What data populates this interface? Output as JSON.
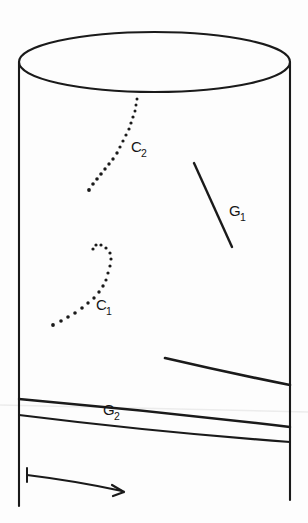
{
  "figure": {
    "background_color": "#fdfdfd",
    "ink_color": "#1a1a1a",
    "width": 308,
    "height": 523
  },
  "labels": {
    "c1": {
      "base": "C",
      "sub": "1",
      "x": 96,
      "y": 310
    },
    "c2": {
      "base": "C",
      "sub": "2",
      "x": 131,
      "y": 152
    },
    "g1": {
      "base": "G",
      "sub": "1",
      "x": 229,
      "y": 216
    },
    "g2": {
      "base": "G",
      "sub": "2",
      "x": 103,
      "y": 415
    }
  },
  "shapes": {
    "cylinder_top_ellipse": {
      "name": "cylinder-top-ellipse",
      "cx": 154.5,
      "cy": 62,
      "rx": 135.5,
      "ry": 30
    },
    "left_edge": {
      "name": "cylinder-left-edge",
      "x": 19,
      "y1": 62,
      "y2": 506
    },
    "right_edge": {
      "name": "cylinder-right-edge",
      "x": 290,
      "y1": 62,
      "y2": 500
    },
    "curve_c2": {
      "name": "dotted-curve-c2",
      "description": "dotted curve from top rim descending left",
      "dots": [
        [
          137,
          99
        ],
        [
          136,
          104
        ],
        [
          135,
          110
        ],
        [
          133,
          116
        ],
        [
          131,
          122
        ],
        [
          129,
          128
        ],
        [
          127,
          134
        ],
        [
          124,
          140
        ],
        [
          121,
          146
        ],
        [
          118,
          152
        ],
        [
          115,
          158
        ],
        [
          112,
          163
        ],
        [
          108,
          168
        ],
        [
          104,
          173
        ],
        [
          100,
          178
        ],
        [
          96,
          182
        ],
        [
          92,
          186
        ],
        [
          88,
          190
        ]
      ]
    },
    "curve_c1": {
      "name": "dotted-curve-c1",
      "description": "dotted curve ascending right with a small hook at top",
      "dots": [
        [
          53,
          325
        ],
        [
          60,
          322
        ],
        [
          67,
          318
        ],
        [
          74,
          314
        ],
        [
          81,
          310
        ],
        [
          87,
          305
        ],
        [
          93,
          300
        ],
        [
          98,
          294
        ],
        [
          102,
          288
        ],
        [
          105,
          282
        ],
        [
          107,
          275
        ],
        [
          109,
          268
        ],
        [
          110,
          261
        ],
        [
          110,
          255
        ],
        [
          108,
          250
        ],
        [
          104,
          246
        ],
        [
          99,
          244
        ],
        [
          95,
          246
        ],
        [
          93,
          250
        ]
      ]
    },
    "segment_g1": {
      "name": "geodesic-segment-g1",
      "x1": 194,
      "y1": 163,
      "x2": 232,
      "y2": 247
    },
    "curve_g2_lower_right": {
      "name": "geodesic-curve-g2-right-branch",
      "path": "M 165 358 Q 225 372 290 385"
    },
    "curve_g2_upper": {
      "name": "geodesic-curve-g2-upper",
      "path": "M 19 399 Q 155 411 290 427"
    },
    "curve_g2_lower": {
      "name": "geodesic-curve-g2-lower",
      "path": "M 19 415 Q 155 432 290 442"
    },
    "arrow": {
      "name": "direction-arrow",
      "path": "M 27 475 Q 76 481 122 491",
      "head": "M 122 491 L 112 486 M 122 491 L 112 496",
      "tail_tick": {
        "x": 27,
        "y1": 468,
        "y2": 482
      }
    },
    "artifact": {
      "name": "scan-artifact-line",
      "path": "M 0 405 L 308 412"
    }
  }
}
